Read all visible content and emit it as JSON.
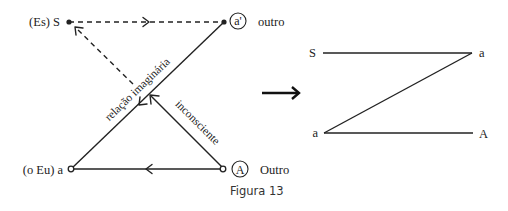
{
  "schema_l": {
    "nodes": {
      "S": {
        "label": "(Es) S"
      },
      "a_prime": {
        "symbol": "a'",
        "label": "outro"
      },
      "a": {
        "label": "(o Eu) a"
      },
      "A": {
        "symbol": "A",
        "label": "Outro"
      }
    },
    "edges": {
      "imaginary": {
        "label": "relação imaginária"
      },
      "unconscious": {
        "label": "inconsciente"
      }
    }
  },
  "z_figure": {
    "top_left": "S",
    "top_right": "a",
    "bottom_left": "a",
    "bottom_right": "A"
  },
  "caption": "Figura 13",
  "colors": {
    "ink": "#222222",
    "background": "#ffffff"
  }
}
